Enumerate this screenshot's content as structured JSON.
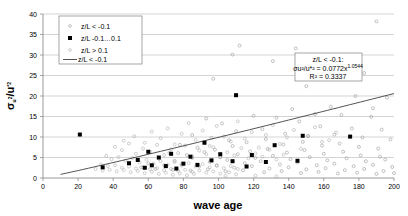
{
  "chart_data": {
    "type": "scatter",
    "title": "",
    "xlabel": "wave age",
    "ylabel": "σu²/u*²",
    "xlim": [
      0,
      200
    ],
    "ylim": [
      0,
      40
    ],
    "xticks": [
      0,
      20,
      40,
      60,
      80,
      100,
      120,
      140,
      160,
      180,
      200
    ],
    "yticks": [
      0,
      5,
      10,
      15,
      20,
      25,
      30,
      35,
      40
    ],
    "grid": "horizontal",
    "legend_position": "top-left",
    "legend": [
      {
        "marker": "open-small",
        "label": "z/L < -0.1"
      },
      {
        "marker": "filled-square",
        "label": "z/L -0.1…0.1"
      },
      {
        "marker": "open-small-2",
        "label": "z/L > 0.1"
      },
      {
        "marker": "line",
        "label": "z/L < -0.1"
      }
    ],
    "annotation": {
      "line1": "z/L < -0.1:",
      "line2_prefix": "σu²/u*² = 0.0772x",
      "line2_exponent": "1.0544",
      "line3_prefix": "R² = ",
      "line3_value": "0.3337"
    },
    "fit": {
      "form": "power",
      "coefficient": 0.0772,
      "exponent": 1.0544,
      "r_squared": 0.3337,
      "x_start": 10,
      "x_end": 200
    },
    "series": [
      {
        "name": "z/L < -0.1",
        "marker": "open-small",
        "points": [
          [
            190,
            38.2
          ],
          [
            112,
            32.3
          ],
          [
            144,
            31.6
          ],
          [
            108,
            30.1
          ],
          [
            131,
            28.5
          ],
          [
            160,
            28.0
          ],
          [
            183,
            25.6
          ],
          [
            97,
            24.2
          ],
          [
            172,
            25.4
          ],
          [
            208,
            23.0
          ],
          [
            150,
            22.4
          ],
          [
            178,
            20.0
          ],
          [
            196,
            19.6
          ],
          [
            164,
            17.4
          ],
          [
            142,
            16.8
          ],
          [
            188,
            17.0
          ],
          [
            204,
            16.3
          ],
          [
            120,
            15.2
          ],
          [
            133,
            14.7
          ],
          [
            155,
            15.6
          ],
          [
            170,
            15.4
          ],
          [
            187,
            14.9
          ],
          [
            93,
            14.5
          ],
          [
            102,
            13.3
          ],
          [
            146,
            13.8
          ],
          [
            158,
            12.6
          ],
          [
            176,
            12.1
          ],
          [
            193,
            11.8
          ],
          [
            110,
            11.4
          ],
          [
            125,
            11.9
          ],
          [
            138,
            10.8
          ],
          [
            151,
            10.2
          ],
          [
            166,
            10.6
          ],
          [
            182,
            9.9
          ],
          [
            198,
            9.4
          ],
          [
            85,
            10.5
          ],
          [
            96,
            9.8
          ],
          [
            106,
            9.2
          ],
          [
            116,
            8.7
          ],
          [
            127,
            9.5
          ],
          [
            137,
            8.2
          ],
          [
            148,
            8.8
          ],
          [
            159,
            7.9
          ],
          [
            169,
            8.4
          ],
          [
            180,
            7.6
          ],
          [
            191,
            7.2
          ],
          [
            201,
            6.9
          ],
          [
            78,
            8.1
          ],
          [
            88,
            7.4
          ],
          [
            98,
            6.9
          ],
          [
            108,
            7.8
          ],
          [
            118,
            6.5
          ],
          [
            128,
            7.1
          ],
          [
            139,
            6.2
          ],
          [
            149,
            6.8
          ],
          [
            160,
            5.9
          ],
          [
            171,
            6.4
          ],
          [
            181,
            5.5
          ],
          [
            192,
            5.2
          ],
          [
            72,
            6.1
          ],
          [
            82,
            5.6
          ],
          [
            92,
            6.3
          ],
          [
            101,
            5.1
          ],
          [
            111,
            5.8
          ],
          [
            121,
            4.9
          ],
          [
            131,
            5.4
          ],
          [
            141,
            4.6
          ],
          [
            152,
            5.1
          ],
          [
            162,
            4.3
          ],
          [
            173,
            4.8
          ],
          [
            184,
            4.1
          ],
          [
            195,
            4.5
          ],
          [
            66,
            4.7
          ],
          [
            75,
            4.2
          ],
          [
            85,
            4.9
          ],
          [
            95,
            3.9
          ],
          [
            105,
            4.4
          ],
          [
            115,
            3.6
          ],
          [
            124,
            4.1
          ],
          [
            135,
            3.3
          ],
          [
            145,
            3.8
          ],
          [
            156,
            3.1
          ],
          [
            166,
            3.5
          ],
          [
            177,
            2.9
          ],
          [
            188,
            3.2
          ],
          [
            199,
            2.7
          ],
          [
            60,
            3.6
          ],
          [
            69,
            3.1
          ],
          [
            79,
            3.4
          ],
          [
            89,
            2.8
          ],
          [
            99,
            3.0
          ],
          [
            109,
            2.5
          ],
          [
            119,
            2.9
          ],
          [
            129,
            2.3
          ],
          [
            140,
            2.6
          ],
          [
            150,
            2.1
          ],
          [
            161,
            2.4
          ],
          [
            172,
            1.9
          ],
          [
            183,
            2.2
          ],
          [
            194,
            1.7
          ],
          [
            56,
            2.6
          ],
          [
            64,
            2.2
          ],
          [
            74,
            2.0
          ],
          [
            84,
            1.8
          ],
          [
            94,
            2.1
          ],
          [
            104,
            1.6
          ],
          [
            114,
            1.9
          ],
          [
            126,
            1.4
          ],
          [
            136,
            1.7
          ],
          [
            147,
            1.2
          ],
          [
            157,
            1.5
          ],
          [
            168,
            1.1
          ],
          [
            179,
            1.3
          ],
          [
            190,
            1.0
          ],
          [
            200,
            1.2
          ]
        ]
      },
      {
        "name": "z/L > 0.1",
        "marker": "open-small-2",
        "points": [
          [
            46,
            9.1
          ],
          [
            52,
            10.2
          ],
          [
            58,
            8.6
          ],
          [
            62,
            11.3
          ],
          [
            67,
            9.7
          ],
          [
            71,
            12.1
          ],
          [
            75,
            8.2
          ],
          [
            79,
            10.8
          ],
          [
            83,
            13.4
          ],
          [
            87,
            9.3
          ],
          [
            91,
            11.6
          ],
          [
            95,
            7.8
          ],
          [
            99,
            12.7
          ],
          [
            103,
            10.1
          ],
          [
            107,
            8.9
          ],
          [
            111,
            13.8
          ],
          [
            115,
            9.6
          ],
          [
            119,
            11.2
          ],
          [
            123,
            7.4
          ],
          [
            127,
            10.5
          ],
          [
            131,
            12.9
          ],
          [
            135,
            8.3
          ],
          [
            139,
            9.9
          ],
          [
            143,
            11.7
          ],
          [
            147,
            7.1
          ],
          [
            151,
            10.3
          ],
          [
            155,
            12.4
          ],
          [
            159,
            8.8
          ],
          [
            163,
            9.2
          ],
          [
            167,
            11.1
          ],
          [
            41,
            7.6
          ],
          [
            45,
            6.8
          ],
          [
            49,
            8.4
          ],
          [
            53,
            5.9
          ],
          [
            57,
            7.2
          ],
          [
            61,
            6.4
          ],
          [
            65,
            8.1
          ],
          [
            69,
            5.6
          ],
          [
            73,
            7.0
          ],
          [
            77,
            6.1
          ],
          [
            81,
            7.9
          ],
          [
            85,
            5.3
          ],
          [
            89,
            6.7
          ],
          [
            93,
            5.8
          ],
          [
            97,
            7.5
          ],
          [
            101,
            5.1
          ],
          [
            105,
            6.3
          ],
          [
            109,
            5.5
          ],
          [
            113,
            7.3
          ],
          [
            117,
            4.8
          ],
          [
            121,
            6.0
          ],
          [
            125,
            5.2
          ],
          [
            129,
            6.9
          ],
          [
            133,
            4.5
          ],
          [
            137,
            5.7
          ],
          [
            36,
            5.4
          ],
          [
            39,
            4.6
          ],
          [
            43,
            5.1
          ],
          [
            47,
            4.2
          ],
          [
            51,
            4.9
          ],
          [
            55,
            3.8
          ],
          [
            59,
            4.4
          ],
          [
            63,
            3.5
          ],
          [
            67,
            4.1
          ],
          [
            71,
            3.2
          ],
          [
            75,
            3.9
          ],
          [
            79,
            3.0
          ],
          [
            83,
            3.6
          ],
          [
            87,
            2.8
          ],
          [
            91,
            3.4
          ],
          [
            95,
            2.6
          ],
          [
            99,
            3.1
          ],
          [
            103,
            2.4
          ],
          [
            107,
            2.9
          ],
          [
            111,
            2.2
          ],
          [
            33,
            3.3
          ],
          [
            37,
            2.9
          ],
          [
            41,
            3.1
          ],
          [
            45,
            2.5
          ],
          [
            49,
            2.8
          ],
          [
            53,
            2.3
          ],
          [
            57,
            2.6
          ],
          [
            61,
            2.1
          ],
          [
            65,
            2.4
          ],
          [
            69,
            1.9
          ],
          [
            73,
            2.2
          ],
          [
            77,
            1.7
          ],
          [
            81,
            2.0
          ],
          [
            85,
            1.5
          ],
          [
            89,
            1.8
          ],
          [
            93,
            1.3
          ],
          [
            97,
            1.6
          ],
          [
            101,
            1.1
          ],
          [
            106,
            1.4
          ],
          [
            110,
            0.9
          ],
          [
            30,
            2.2
          ],
          [
            34,
            1.8
          ],
          [
            38,
            2.0
          ],
          [
            42,
            1.6
          ],
          [
            46,
            1.9
          ],
          [
            50,
            1.4
          ],
          [
            54,
            1.7
          ],
          [
            58,
            1.2
          ],
          [
            62,
            1.5
          ],
          [
            66,
            1.0
          ],
          [
            70,
            1.3
          ],
          [
            74,
            0.8
          ],
          [
            78,
            1.1
          ],
          [
            82,
            0.7
          ],
          [
            86,
            1.0
          ],
          [
            104,
            0.5
          ],
          [
            121,
            0.6
          ],
          [
            133,
            0.4
          ]
        ]
      },
      {
        "name": "z/L -0.1…0.1",
        "marker": "filled-square",
        "points": [
          [
            110,
            20.2
          ],
          [
            21,
            10.6
          ],
          [
            148,
            10.3
          ],
          [
            175,
            10.1
          ],
          [
            132,
            8.0
          ],
          [
            92,
            8.6
          ],
          [
            60,
            6.4
          ],
          [
            73,
            5.9
          ],
          [
            101,
            5.8
          ],
          [
            119,
            5.6
          ],
          [
            84,
            5.2
          ],
          [
            66,
            5.0
          ],
          [
            54,
            4.4
          ],
          [
            96,
            4.3
          ],
          [
            108,
            4.1
          ],
          [
            145,
            4.2
          ],
          [
            127,
            3.9
          ],
          [
            49,
            3.6
          ],
          [
            80,
            3.5
          ],
          [
            88,
            3.2
          ],
          [
            62,
            3.1
          ],
          [
            70,
            2.9
          ],
          [
            116,
            2.8
          ],
          [
            34,
            2.6
          ],
          [
            58,
            2.5
          ],
          [
            76,
            2.3
          ]
        ]
      }
    ]
  }
}
